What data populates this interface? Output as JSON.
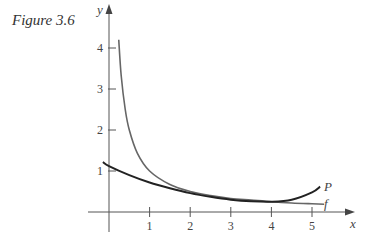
{
  "caption": "Figure 3.6",
  "chart_data": {
    "type": "line",
    "title": "Figure 3.6",
    "xlabel": "x",
    "ylabel": "y",
    "xlim": [
      -0.6,
      6.2
    ],
    "ylim": [
      -0.5,
      4.6
    ],
    "x_ticks": [
      1,
      2,
      3,
      4,
      5
    ],
    "y_ticks": [
      1,
      2,
      3,
      4
    ],
    "grid": false,
    "legend": "inline labels at right end of curves",
    "series": [
      {
        "name": "f",
        "x": [
          0.24,
          0.3,
          0.4,
          0.5,
          0.7,
          1.0,
          1.5,
          2.0,
          2.5,
          3.0,
          3.5,
          4.0,
          4.5,
          5.0,
          5.3
        ],
        "y": [
          4.2,
          3.33,
          2.5,
          2.0,
          1.43,
          1.0,
          0.67,
          0.5,
          0.4,
          0.33,
          0.29,
          0.25,
          0.22,
          0.2,
          0.19
        ]
      },
      {
        "name": "P",
        "x": [
          -0.15,
          0.0,
          0.5,
          1.0,
          1.5,
          2.0,
          2.5,
          3.0,
          3.5,
          4.0,
          4.5,
          5.0,
          5.2
        ],
        "y": [
          1.22,
          1.12,
          0.9,
          0.72,
          0.58,
          0.46,
          0.37,
          0.3,
          0.26,
          0.25,
          0.3,
          0.48,
          0.62
        ]
      }
    ]
  },
  "labels": {
    "y_axis": "y",
    "x_axis": "x",
    "curve_f": "f",
    "curve_P": "P",
    "ticks_x": [
      "1",
      "2",
      "3",
      "4",
      "5"
    ],
    "ticks_y": [
      "1",
      "2",
      "3",
      "4"
    ]
  }
}
